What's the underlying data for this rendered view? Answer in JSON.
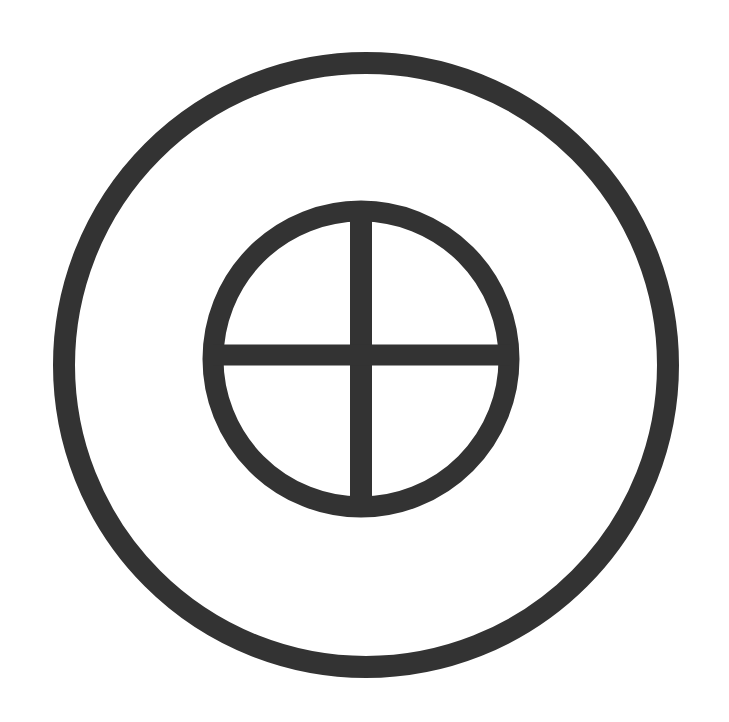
{
  "symbol": {
    "name": "Circled cross within ring (Earth / sun-cross symbol)",
    "stroke_color": "#333333",
    "background_color": "#ffffff",
    "outer_ring": {
      "cx": 366,
      "cy": 365,
      "r": 302,
      "stroke_width": 22
    },
    "inner_circle": {
      "cx": 361,
      "cy": 359,
      "r": 148,
      "stroke_width": 21
    },
    "vertical_bar": {
      "x": 361,
      "y1": 211,
      "y2": 508,
      "stroke_width": 22
    },
    "horizontal_bar": {
      "y": 355,
      "x1": 213,
      "x2": 510,
      "stroke_width": 21
    }
  }
}
